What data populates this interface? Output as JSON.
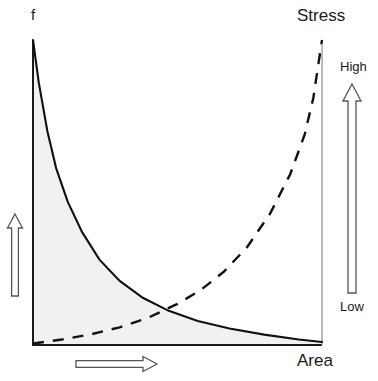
{
  "figure": {
    "background_color": "#ffffff",
    "axis_color": "#1a1a1a",
    "curve_color": "#111111",
    "fill_color": "#f1f1f1",
    "arrow_color": "#555555",
    "labels": {
      "y_axis": "f",
      "x_axis": "Area",
      "secondary_axis": "Stress",
      "scale_high": "High",
      "scale_low": "Low"
    }
  },
  "chart_data": {
    "type": "line",
    "title": "",
    "xlabel": "Area",
    "ylabel": "f",
    "secondary_ylabel": "Stress",
    "xlim": [
      0,
      1
    ],
    "ylim": [
      0,
      1
    ],
    "grid": false,
    "legend": "none",
    "annotations": [
      {
        "name": "y-axis-direction-arrow",
        "text": "",
        "direction": "up",
        "position": "left-outside"
      },
      {
        "name": "x-axis-direction-arrow",
        "text": "",
        "direction": "right",
        "position": "bottom-outside"
      },
      {
        "name": "stress-scale-arrow",
        "text": "High / Low",
        "direction": "up",
        "position": "right-outside"
      }
    ],
    "series": [
      {
        "name": "f (solid, decaying)",
        "style": "solid",
        "filled": true,
        "x": [
          0.0,
          0.02,
          0.05,
          0.08,
          0.12,
          0.17,
          0.23,
          0.3,
          0.38,
          0.47,
          0.57,
          0.68,
          0.8,
          0.92,
          1.0
        ],
        "y": [
          1.0,
          0.86,
          0.7,
          0.58,
          0.47,
          0.37,
          0.28,
          0.21,
          0.155,
          0.112,
          0.079,
          0.054,
          0.034,
          0.018,
          0.01
        ]
      },
      {
        "name": "Stress (dashed, rising)",
        "style": "dashed",
        "filled": false,
        "x": [
          0.0,
          0.1,
          0.2,
          0.3,
          0.4,
          0.5,
          0.58,
          0.66,
          0.74,
          0.82,
          0.89,
          0.94,
          0.97,
          1.0
        ],
        "y": [
          0.005,
          0.018,
          0.035,
          0.058,
          0.09,
          0.135,
          0.18,
          0.24,
          0.32,
          0.43,
          0.56,
          0.69,
          0.81,
          1.0
        ]
      }
    ],
    "crossing_point": {
      "x": 0.5,
      "y": 0.135
    }
  }
}
